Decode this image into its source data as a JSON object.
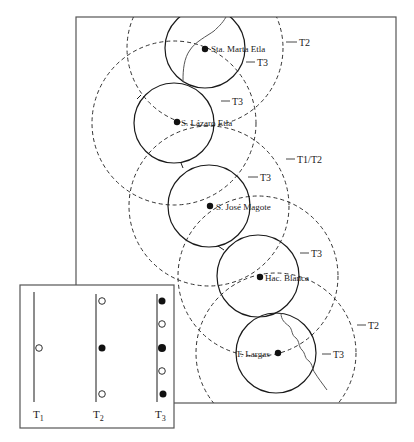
{
  "diagram": {
    "type": "central-place-catchment-map",
    "map_frame": {
      "x": 76,
      "y": 17,
      "w": 320,
      "h": 386
    },
    "towns": [
      {
        "name": "Sta. Marta Etla",
        "cx": 205,
        "cy": 48,
        "inner_r": 40,
        "outer_r": 78,
        "inner_tier": "T3",
        "outer_tier": "T2"
      },
      {
        "name": "S. Lázaro Etla",
        "cx": 174,
        "cy": 123,
        "inner_r": 40,
        "outer_r": 82,
        "inner_tier": "T3",
        "outer_tier": ""
      },
      {
        "name": "S. José Magote",
        "cx": 209,
        "cy": 206,
        "inner_r": 41,
        "outer_r": 80,
        "inner_tier": "T3",
        "outer_tier": "T1/T2"
      },
      {
        "name": "Hac. Blanca",
        "cx": 258,
        "cy": 276,
        "inner_r": 41,
        "outer_r": 80,
        "inner_tier": "T3",
        "outer_tier": ""
      },
      {
        "name": "T. Largas",
        "cx": 276,
        "cy": 353,
        "inner_r": 40,
        "outer_r": 80,
        "inner_tier": "T3",
        "outer_tier": "T2"
      }
    ],
    "tier_labels": [
      {
        "text": "T2",
        "x": 330,
        "y": 46
      },
      {
        "text": "T3",
        "x": 298,
        "y": 67
      },
      {
        "text": "T3",
        "x": 266,
        "y": 105
      },
      {
        "text": "T1/T2",
        "x": 330,
        "y": 163
      },
      {
        "text": "T3",
        "x": 298,
        "y": 181
      },
      {
        "text": "T3",
        "x": 320,
        "y": 256
      },
      {
        "text": "T2",
        "x": 360,
        "y": 329
      },
      {
        "text": "T3",
        "x": 334,
        "y": 358
      }
    ],
    "town_labels": {
      "sta_marta": "Sta. Marta Etla",
      "s_lazaro": "S. Lázaro Etla",
      "s_jose": "S. José Magote",
      "hac_blanca": "Hac. Blanca",
      "t_largas": "T. Largas"
    },
    "legend": {
      "frame": {
        "x": 20,
        "y": 285,
        "w": 154,
        "h": 143
      },
      "columns": [
        {
          "label": "T",
          "sub": "1",
          "x": 34,
          "dots": [
            {
              "y": 348,
              "filled": false
            }
          ]
        },
        {
          "label": "T",
          "sub": "2",
          "x": 96,
          "dots": [
            {
              "y": 301,
              "filled": false
            },
            {
              "y": 348,
              "filled": true
            },
            {
              "y": 394,
              "filled": false
            }
          ]
        },
        {
          "label": "T",
          "sub": "3",
          "x": 157,
          "dots": [
            {
              "y": 301,
              "filled": true
            },
            {
              "y": 324,
              "filled": false
            },
            {
              "y": 348,
              "filled": true
            },
            {
              "y": 371,
              "filled": false
            },
            {
              "y": 394,
              "filled": true
            }
          ]
        }
      ]
    },
    "colors": {
      "ink": "#1a1a1a",
      "dash": "#333333",
      "river": "#555555",
      "frame": "#555555"
    }
  }
}
